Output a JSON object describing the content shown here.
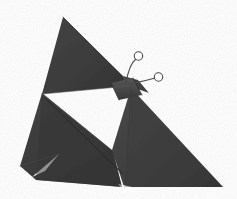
{
  "image": {
    "subject": "origami butterfly",
    "medium": "folded paper photograph",
    "background_color": "#ffffff",
    "width": 237,
    "height": 199
  },
  "palette": {
    "background": "#ffffff",
    "paper_dark": "#3b3b3b",
    "paper_mid": "#454545",
    "paper_light": "#4f4f4f",
    "paper_shadow": "#2f2f2f",
    "crease_line": "#2b2b2b",
    "crease_highlight": "#575757",
    "antenna_line": "#4a4a4a",
    "antenna_tip_fill": "#ffffff",
    "edge_outline": "#333333"
  },
  "parts": {
    "upper_wing": {
      "name": "upper left wing",
      "color": "#3d3d3d",
      "points": "63,17 42,93 128,85 122,76"
    },
    "upper_wing_right": {
      "name": "upper right wing",
      "color": "#3f3f3f",
      "points": "122,76 128,85 147,92 137,79"
    },
    "right_wing": {
      "name": "lower right wing",
      "color": "#414141",
      "points": "131,88 222,186 126,186 113,151"
    },
    "left_wing": {
      "name": "lower left wing",
      "color": "#3c3c3c",
      "points": "42,93 20,166 36,180 120,186 113,151"
    },
    "left_wing_lower_flap": {
      "name": "lower left wing flap",
      "color": "#454545",
      "points": "30,174 36,180 122,186 100,166"
    },
    "body_band": {
      "name": "butterfly body band",
      "color": "#4d4d4d",
      "points": "112,84 132,79 140,94 120,99"
    },
    "white_notch": {
      "name": "white wedge notch",
      "color": "#ffffff",
      "points": "44,170 58,155 33,176"
    },
    "bottom_notch": {
      "name": "bottom edge notch",
      "color": "#ffffff",
      "points": "119,184 131,186 126,192"
    }
  },
  "creases": [
    {
      "name": "upper wing right fold",
      "path": "M63,17 L122,77",
      "color": "#2e2e2e",
      "width": 0.9
    },
    {
      "name": "upper wing bottom fold",
      "path": "M42,93 L128,85",
      "color": "#555555",
      "width": 0.9
    },
    {
      "name": "left wing diagonal fold",
      "path": "M47,100 L122,172",
      "color": "#2c2c2c",
      "width": 1.0
    },
    {
      "name": "left wing inner fold",
      "path": "M42,93 L113,151",
      "color": "#515151",
      "width": 0.8
    },
    {
      "name": "right wing inner fold",
      "path": "M131,88 L126,186",
      "color": "#383838",
      "width": 0.8
    },
    {
      "name": "body left fold",
      "path": "M112,84 L120,99",
      "color": "#2a2a2a",
      "width": 0.9
    },
    {
      "name": "body right fold",
      "path": "M132,79 L140,94",
      "color": "#2a2a2a",
      "width": 0.9
    },
    {
      "name": "left tip fold",
      "path": "M20,166 L58,155",
      "color": "#4a4a4a",
      "width": 0.8
    }
  ],
  "antennae": [
    {
      "name": "upper antenna",
      "path": "M126,82 C128,70 132,62 136,59",
      "tip": {
        "cx": 138.5,
        "cy": 56.0,
        "r": 4.2
      },
      "stroke": "#4a4a4a",
      "width": 1.1
    },
    {
      "name": "lower antenna",
      "path": "M126,83 C136,82 148,80 155,78",
      "tip": {
        "cx": 158.5,
        "cy": 77.0,
        "r": 4.2
      },
      "stroke": "#4a4a4a",
      "width": 1.1
    }
  ],
  "labels": {
    "figure_alt": "Dark charcoal origami butterfly with two curled antennae on a white background"
  }
}
